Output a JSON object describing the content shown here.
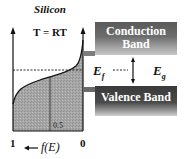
{
  "diagram": {
    "title": "Silicon",
    "temperature_label": "T = RT",
    "conduction_band": {
      "line1": "Conduction",
      "line2": "Band"
    },
    "valence_band": {
      "label": "Valence Band"
    },
    "fermi_level": {
      "symbol": "E",
      "subscript": "f"
    },
    "band_gap": {
      "symbol": "E",
      "subscript": "g"
    },
    "x_axis": {
      "left_tick": "1",
      "right_tick": "0",
      "mid_tick": "0.5",
      "label": "f(E)",
      "arrow": "←"
    },
    "colors": {
      "shading": "#a9a9a9",
      "band_dark": "#4a4a4a",
      "axis": "#111111"
    }
  }
}
